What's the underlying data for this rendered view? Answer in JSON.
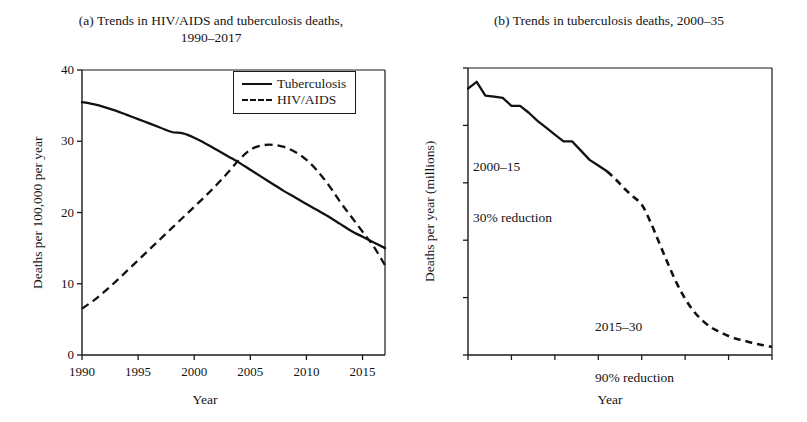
{
  "figure": {
    "width": 807,
    "height": 422,
    "background": "#ffffff",
    "line_color": "#111111"
  },
  "panel_a": {
    "label": "(a)",
    "title_line1": "(a) Trends in HIV/AIDS and tuberculosis deaths,",
    "title_line2": "1990–2017",
    "xlabel": "Year",
    "ylabel": "Deaths per 100,000 per year",
    "xticks": [
      "1990",
      "1995",
      "2000",
      "2005",
      "2010",
      "2015"
    ],
    "yticks": [
      "0",
      "10",
      "20",
      "30",
      "40"
    ],
    "legend": [
      {
        "label": "Tuberculosis",
        "style": "solid"
      },
      {
        "label": "HIV/AIDS",
        "style": "dashed"
      }
    ]
  },
  "panel_b": {
    "label": "(b)",
    "title": "(b) Trends in tuberculosis deaths, 2000–35",
    "xlabel": "Year",
    "ylabel": "Deaths per year (millions)",
    "xticks": [
      "2000",
      "2005",
      "2010",
      "2015",
      "2020",
      "2025",
      "2030",
      "2035"
    ],
    "yticks": [
      "0.0",
      "0.5",
      "1.0",
      "1.5",
      "2.0",
      "2.5"
    ],
    "annotations": [
      {
        "line1": "2000–15",
        "line2": "30% reduction"
      },
      {
        "line1": "2015–30",
        "line2": "90% reduction"
      }
    ]
  },
  "chart_data": [
    {
      "type": "line",
      "panel": "a",
      "title": "(a) Trends in HIV/AIDS and tuberculosis deaths, 1990–2017",
      "xlabel": "Year",
      "ylabel": "Deaths per 100,000 per year",
      "xlim": [
        1990,
        2017
      ],
      "ylim": [
        0,
        40
      ],
      "xticks": [
        1990,
        1995,
        2000,
        2005,
        2010,
        2015
      ],
      "yticks": [
        0,
        10,
        20,
        30,
        40
      ],
      "grid": false,
      "legend_position": "top-right",
      "x": [
        1990,
        1991,
        1992,
        1993,
        1994,
        1995,
        1996,
        1997,
        1998,
        1999,
        2000,
        2001,
        2002,
        2003,
        2004,
        2005,
        2006,
        2007,
        2008,
        2009,
        2010,
        2011,
        2012,
        2013,
        2014,
        2015,
        2016,
        2017
      ],
      "series": [
        {
          "name": "Tuberculosis",
          "style": "solid",
          "values": [
            35.5,
            35.2,
            34.8,
            34.3,
            33.7,
            33.1,
            32.5,
            31.9,
            31.3,
            31.1,
            30.5,
            29.7,
            28.8,
            27.9,
            27.0,
            26.0,
            25.0,
            24.0,
            23.0,
            22.1,
            21.2,
            20.3,
            19.4,
            18.4,
            17.4,
            16.6,
            15.8,
            15.0
          ]
        },
        {
          "name": "HIV/AIDS",
          "style": "dashed",
          "values": [
            6.5,
            7.6,
            8.9,
            10.3,
            11.8,
            13.3,
            14.8,
            16.3,
            17.8,
            19.3,
            20.8,
            22.3,
            23.9,
            25.6,
            27.4,
            28.8,
            29.4,
            29.5,
            29.2,
            28.5,
            27.4,
            25.8,
            23.8,
            21.5,
            19.4,
            17.3,
            15.2,
            12.6
          ]
        }
      ]
    },
    {
      "type": "line",
      "panel": "b",
      "title": "(b) Trends in tuberculosis deaths, 2000–35",
      "xlabel": "Year",
      "ylabel": "Deaths per year (millions)",
      "xlim": [
        2000,
        2035
      ],
      "ylim": [
        0.0,
        2.5
      ],
      "xticks": [
        2000,
        2005,
        2010,
        2015,
        2020,
        2025,
        2030,
        2035
      ],
      "yticks": [
        0.0,
        0.5,
        1.0,
        1.5,
        2.0,
        2.5
      ],
      "grid": false,
      "annotations": [
        "2000–15 30% reduction",
        "2015–30 90% reduction"
      ],
      "series": [
        {
          "name": "Observed tuberculosis deaths",
          "style": "solid",
          "x": [
            2000,
            2001,
            2002,
            2003,
            2004,
            2005,
            2006,
            2007,
            2008,
            2009,
            2010,
            2011,
            2012,
            2013,
            2014,
            2015,
            2016
          ],
          "values": [
            2.32,
            2.38,
            2.26,
            2.25,
            2.24,
            2.17,
            2.17,
            2.11,
            2.04,
            1.98,
            1.92,
            1.86,
            1.86,
            1.78,
            1.7,
            1.65,
            1.6
          ]
        },
        {
          "name": "Projected tuberculosis deaths",
          "style": "dashed",
          "x": [
            2016,
            2017,
            2018,
            2019,
            2020,
            2021,
            2022,
            2023,
            2024,
            2025,
            2026,
            2027,
            2028,
            2029,
            2030,
            2031,
            2032,
            2033,
            2034,
            2035
          ],
          "values": [
            1.6,
            1.53,
            1.45,
            1.38,
            1.31,
            1.16,
            0.98,
            0.8,
            0.63,
            0.49,
            0.38,
            0.3,
            0.24,
            0.2,
            0.165,
            0.14,
            0.12,
            0.1,
            0.085,
            0.07
          ]
        }
      ]
    }
  ]
}
